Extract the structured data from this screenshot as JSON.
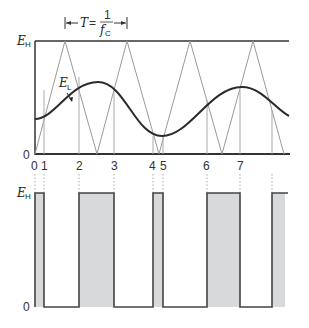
{
  "diagram": {
    "period_label": {
      "T": "T",
      "eq": "=",
      "num": "1",
      "den_f": "f",
      "den_sub": "C"
    },
    "top_plot": {
      "y_labels": {
        "high": {
          "E": "E",
          "sub": "H"
        },
        "zero": "0"
      },
      "curve_label": {
        "E": "E",
        "sub": "L"
      },
      "x_ticks": [
        "0",
        "1",
        "2",
        "3",
        "4",
        "5",
        "6",
        "7"
      ]
    },
    "bottom_plot": {
      "y_labels": {
        "high": {
          "E": "E",
          "sub": "H"
        },
        "zero": "0"
      }
    },
    "colors": {
      "axis": "#333333",
      "triangle": "#9a9a9a",
      "curve": "#2a2a2a",
      "fill": "#d7d9da",
      "dotted": "#aaaaaa"
    }
  }
}
